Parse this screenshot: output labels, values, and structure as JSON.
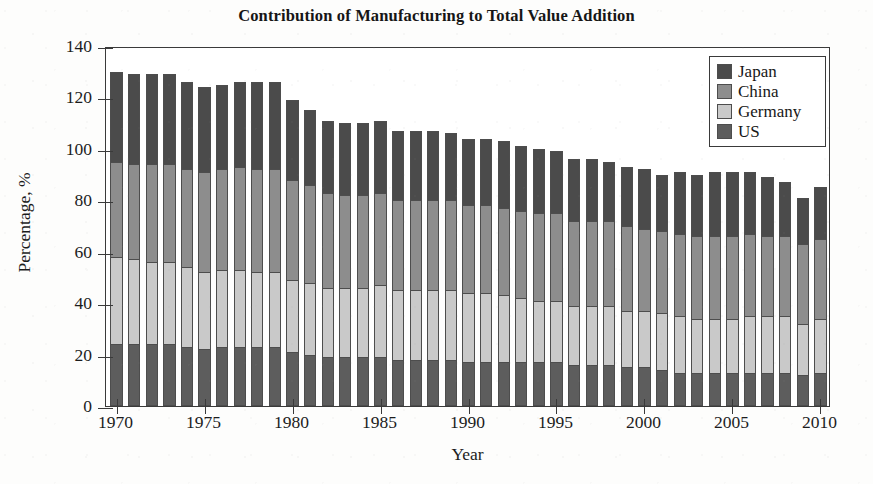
{
  "chart_data": {
    "type": "bar",
    "subtype": "stacked-bar",
    "title": "Contribution of Manufacturing to Total Value Addition",
    "xlabel": "Year",
    "ylabel": "Percentage, %",
    "ylim": [
      0,
      140
    ],
    "ytick_values": [
      0,
      20,
      40,
      60,
      80,
      100,
      120,
      140
    ],
    "xtick_values": [
      1970,
      1975,
      1980,
      1985,
      1990,
      1995,
      2000,
      2005,
      2010
    ],
    "xlim": [
      1969.4,
      2010.6
    ],
    "grid": false,
    "legend_position": "top-right",
    "stack_order_bottom_to_top": [
      "US",
      "Germany",
      "China",
      "Japan"
    ],
    "categories": [
      1970,
      1971,
      1972,
      1973,
      1974,
      1975,
      1976,
      1977,
      1978,
      1979,
      1980,
      1981,
      1982,
      1983,
      1984,
      1985,
      1986,
      1987,
      1988,
      1989,
      1990,
      1991,
      1992,
      1993,
      1994,
      1995,
      1996,
      1997,
      1998,
      1999,
      2000,
      2001,
      2002,
      2003,
      2004,
      2005,
      2006,
      2007,
      2008,
      2009,
      2010
    ],
    "series": [
      {
        "name": "US",
        "color": "#5d5d5d",
        "values": [
          24,
          24,
          24,
          24,
          23,
          22,
          23,
          23,
          23,
          23,
          21,
          20,
          19,
          19,
          19,
          19,
          18,
          18,
          18,
          18,
          17,
          17,
          17,
          17,
          17,
          17,
          16,
          16,
          16,
          15,
          15,
          14,
          13,
          13,
          13,
          13,
          13,
          13,
          13,
          12,
          13
        ]
      },
      {
        "name": "Germany",
        "color": "#c9c9c9",
        "values": [
          34,
          33,
          32,
          32,
          31,
          30,
          30,
          30,
          29,
          29,
          28,
          28,
          27,
          27,
          27,
          28,
          27,
          27,
          27,
          27,
          27,
          27,
          26,
          25,
          24,
          24,
          23,
          23,
          23,
          22,
          22,
          22,
          22,
          21,
          21,
          21,
          22,
          22,
          22,
          20,
          21
        ]
      },
      {
        "name": "China",
        "color": "#8d8d8d",
        "values": [
          37,
          37,
          38,
          38,
          38,
          39,
          39,
          40,
          40,
          40,
          39,
          38,
          37,
          36,
          36,
          36,
          35,
          35,
          35,
          35,
          34,
          34,
          34,
          34,
          34,
          34,
          33,
          33,
          33,
          33,
          32,
          32,
          32,
          32,
          32,
          32,
          32,
          31,
          31,
          31,
          31
        ]
      },
      {
        "name": "Japan",
        "color": "#4b4b4b",
        "values": [
          35,
          35,
          35,
          35,
          34,
          33,
          33,
          33,
          34,
          34,
          31,
          29,
          28,
          28,
          28,
          28,
          27,
          27,
          27,
          26,
          26,
          26,
          26,
          25,
          25,
          24,
          24,
          24,
          23,
          23,
          23,
          22,
          24,
          24,
          25,
          25,
          24,
          23,
          21,
          18,
          20
        ]
      }
    ],
    "totals": [
      130,
      129,
      129,
      129,
      126,
      124,
      125,
      126,
      126,
      126,
      119,
      115,
      111,
      110,
      110,
      111,
      107,
      107,
      107,
      106,
      104,
      104,
      103,
      101,
      100,
      99,
      96,
      96,
      95,
      93,
      92,
      90,
      91,
      90,
      91,
      91,
      91,
      89,
      87,
      81,
      85
    ]
  },
  "legend": {
    "items": [
      {
        "label": "Japan",
        "color": "#4b4b4b"
      },
      {
        "label": "China",
        "color": "#8d8d8d"
      },
      {
        "label": "Germany",
        "color": "#c9c9c9"
      },
      {
        "label": "US",
        "color": "#5d5d5d"
      }
    ]
  }
}
